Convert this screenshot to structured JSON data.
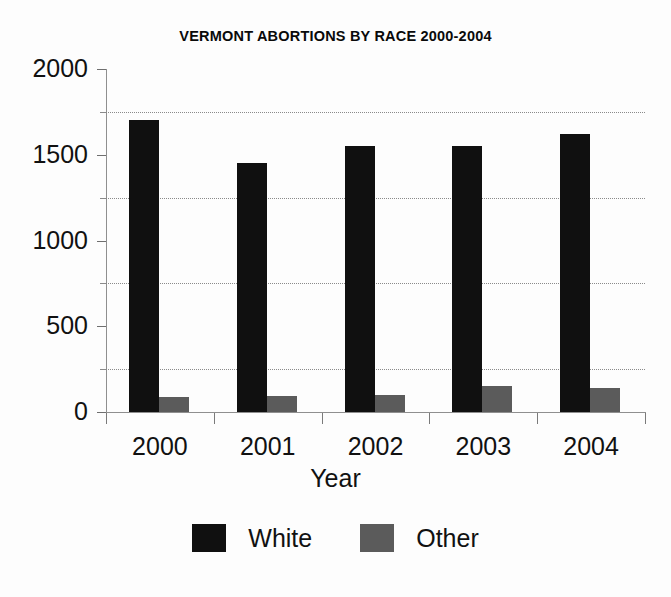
{
  "chart_data": {
    "type": "bar",
    "title": "VERMONT ABORTIONS BY RACE 2000-2004",
    "xlabel": "Year",
    "ylabel": "",
    "categories": [
      "2000",
      "2001",
      "2002",
      "2003",
      "2004"
    ],
    "series": [
      {
        "name": "White",
        "color": "#101010",
        "values": [
          1700,
          1450,
          1550,
          1550,
          1620
        ]
      },
      {
        "name": "Other",
        "color": "#5b5b5b",
        "values": [
          90,
          95,
          100,
          150,
          140
        ]
      }
    ],
    "ylim": [
      0,
      2000
    ],
    "yticks": [
      0,
      500,
      1000,
      1500,
      2000
    ],
    "ytick_labels": [
      "0",
      "500",
      "1000",
      "1500",
      "2000"
    ],
    "yminor_ticks": [
      250,
      750,
      1250,
      1750
    ],
    "grid": "horizontal-dotted-minor",
    "legend_position": "bottom-center",
    "legend_entries": [
      "White",
      "Other"
    ]
  }
}
